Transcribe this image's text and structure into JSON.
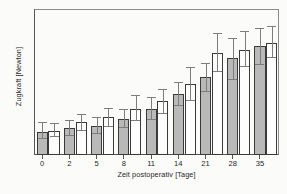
{
  "chart_data": {
    "type": "bar",
    "title": "",
    "subtitle": "",
    "xlabel": "Zeit postoperativ [Tage]",
    "ylabel": "Zugkraft [Newton]",
    "categories": [
      "0",
      "2",
      "5",
      "8",
      "11",
      "14",
      "21",
      "28",
      "35"
    ],
    "ylim": [
      0,
      60
    ],
    "yticks": [
      0,
      10,
      20,
      30,
      40,
      50,
      60
    ],
    "ytick_labels": [
      "0",
      "10",
      "20",
      "30",
      "40",
      "50",
      "60"
    ],
    "grid": false,
    "legend": "none",
    "error_bars": "whiskers with caps (standard deviation)",
    "series": [
      {
        "name": "series-1-gray",
        "fill": "gray",
        "values": [
          9.5,
          11.0,
          12.0,
          15.0,
          19.0,
          25.0,
          32.0,
          40.0,
          45.0
        ],
        "err_low": [
          6.5,
          8.0,
          8.5,
          11.0,
          14.5,
          20.0,
          26.0,
          31.0,
          37.0
        ],
        "err_high": [
          13.5,
          14.5,
          15.5,
          19.0,
          24.0,
          30.0,
          38.0,
          48.0,
          52.0
        ]
      },
      {
        "name": "series-2-white",
        "fill": "white",
        "values": [
          10.0,
          13.5,
          15.5,
          19.0,
          22.0,
          29.0,
          42.0,
          43.0,
          46.0
        ],
        "err_low": [
          7.5,
          10.0,
          11.5,
          14.0,
          17.0,
          22.0,
          34.0,
          36.0,
          40.0
        ],
        "err_high": [
          13.0,
          17.0,
          19.5,
          24.5,
          27.0,
          36.0,
          50.0,
          51.0,
          53.0
        ]
      }
    ]
  }
}
